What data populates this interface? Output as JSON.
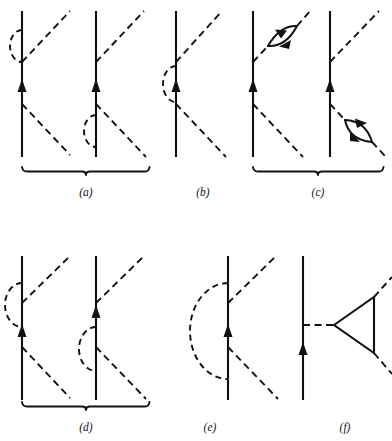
{
  "figure": {
    "caption_labels": [
      {
        "id": "a",
        "text": "(a)",
        "x": 86,
        "y": 196
      },
      {
        "id": "b",
        "text": "(b)",
        "x": 203,
        "y": 196
      },
      {
        "id": "c",
        "text": "(c)",
        "x": 318,
        "y": 196
      },
      {
        "id": "d",
        "text": "(d)",
        "x": 86,
        "y": 431
      },
      {
        "id": "e",
        "text": "(e)",
        "x": 210,
        "y": 431
      },
      {
        "id": "f",
        "text": "(f)",
        "x": 345,
        "y": 431
      }
    ],
    "colors": {
      "ink": "#111111",
      "background": "#ffffff"
    },
    "panels": [
      {
        "id": "a",
        "label": "(a)",
        "graph_count": 2,
        "bracketed": true,
        "description": "two Goldstone diagrams joined by a horizontal brace"
      },
      {
        "id": "b",
        "label": "(b)",
        "graph_count": 1,
        "bracketed": false,
        "description": "single diagram with dashed self-energy arc at the arrow vertex"
      },
      {
        "id": "c",
        "label": "(c)",
        "graph_count": 2,
        "bracketed": true,
        "description": "two diagrams each carrying a lens-shaped particle-hole bubble on a dashed interaction line"
      },
      {
        "id": "d",
        "label": "(d)",
        "graph_count": 2,
        "bracketed": true,
        "description": "two diagrams with large dashed arcs spanning two vertices"
      },
      {
        "id": "e",
        "label": "(e)",
        "graph_count": 1,
        "bracketed": false,
        "description": "single diagram with a large dashed semicircular arc to the left of the fermion line"
      },
      {
        "id": "f",
        "label": "(f)",
        "graph_count": 1,
        "bracketed": false,
        "description": "single diagram with a solid triangle vertex correction"
      }
    ],
    "braces": [
      {
        "id": "brace-a",
        "x_start": 22,
        "x_end": 148,
        "y": 171,
        "notch_x": 86
      },
      {
        "id": "brace-c",
        "x_start": 253,
        "x_end": 383,
        "y": 171,
        "notch_x": 318
      },
      {
        "id": "brace-d",
        "x_start": 22,
        "x_end": 148,
        "y": 406,
        "notch_x": 86
      }
    ],
    "legend": {
      "solid_line_meaning": "fermion propagator",
      "dashed_line_meaning": "interaction line",
      "arrow_meaning": "particle direction",
      "bubble_meaning": "particle-hole bubble insertion"
    }
  }
}
